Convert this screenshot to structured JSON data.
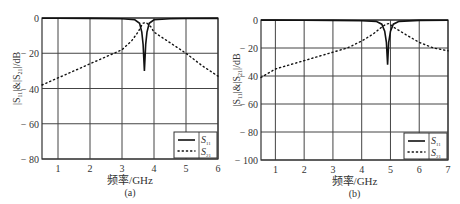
{
  "chart_data": [
    {
      "type": "line",
      "caption": "(a)",
      "xlabel": "频率/GHz",
      "ylabel": "|S11|&|S21|/dB",
      "xlim": [
        0.5,
        6
      ],
      "ylim": [
        -80,
        0
      ],
      "xticks": [
        1,
        2,
        3,
        4,
        5,
        6
      ],
      "yticks": [
        0,
        -20,
        -40,
        -60,
        -80
      ],
      "ytick_labels": [
        "0",
        "-20",
        "-40",
        "-60",
        "-80"
      ],
      "grid": true,
      "legend": {
        "position": "lower right",
        "entries": [
          "S11",
          "S21"
        ]
      },
      "series": [
        {
          "name": "S11",
          "style": "solid",
          "x": [
            0.5,
            1,
            2,
            3,
            3.4,
            3.55,
            3.62,
            3.66,
            3.7,
            3.74,
            3.78,
            3.85,
            4.0,
            4.5,
            5,
            6
          ],
          "y": [
            -0.1,
            -0.1,
            -0.2,
            -0.4,
            -1,
            -3,
            -8,
            -15,
            -30,
            -15,
            -8,
            -3,
            -1,
            -0.4,
            -0.3,
            -0.2
          ]
        },
        {
          "name": "S21",
          "style": "dotted",
          "x": [
            0.5,
            1,
            1.5,
            2,
            2.5,
            3,
            3.3,
            3.5,
            3.65,
            3.75,
            3.9,
            4.0,
            4.5,
            5,
            5.5,
            6
          ],
          "y": [
            -38,
            -34,
            -30,
            -26,
            -22,
            -18,
            -13,
            -8,
            -3,
            -2.5,
            -5,
            -8,
            -14,
            -20,
            -27,
            -33
          ]
        }
      ]
    },
    {
      "type": "line",
      "caption": "(b)",
      "xlabel": "频率/GHz",
      "ylabel": "|S11|&|S21|/dB",
      "xlim": [
        0.5,
        7
      ],
      "ylim": [
        -100,
        0
      ],
      "xticks": [
        1,
        2,
        3,
        4,
        5,
        6,
        7
      ],
      "yticks": [
        0,
        -20,
        -40,
        -60,
        -80,
        -100
      ],
      "ytick_labels": [
        "0",
        "-20",
        "-40",
        "-60",
        "-80",
        "-100"
      ],
      "grid": true,
      "legend": {
        "position": "lower right",
        "entries": [
          "S11",
          "S21"
        ]
      },
      "series": [
        {
          "name": "S11",
          "style": "solid",
          "x": [
            0.5,
            1,
            2,
            3,
            4,
            4.5,
            4.7,
            4.8,
            4.86,
            4.9,
            4.94,
            5.0,
            5.1,
            5.3,
            6,
            7
          ],
          "y": [
            -0.1,
            -0.1,
            -0.2,
            -0.3,
            -0.5,
            -1,
            -3,
            -8,
            -16,
            -32,
            -16,
            -8,
            -3,
            -1,
            -0.3,
            -0.2
          ]
        },
        {
          "name": "S21",
          "style": "dotted",
          "x": [
            0.5,
            1,
            2,
            3,
            3.5,
            4,
            4.4,
            4.7,
            4.85,
            4.95,
            5.1,
            5.5,
            6,
            6.5,
            7
          ],
          "y": [
            -41,
            -35,
            -29,
            -23,
            -20,
            -15,
            -10,
            -5,
            -3,
            -2.5,
            -5,
            -10,
            -16,
            -20,
            -22
          ]
        }
      ]
    }
  ],
  "panels": [
    {
      "caption": "(a)",
      "xlabel": "频率/GHz",
      "ylabel": "|S11|&|S21|/dB",
      "legend_s11": "S",
      "legend_s11_sub": "11",
      "legend_s21": "S",
      "legend_s21_sub": "21"
    },
    {
      "caption": "(b)",
      "xlabel": "频率/GHz",
      "ylabel": "|S11|&|S21|/dB",
      "legend_s11": "S",
      "legend_s11_sub": "11",
      "legend_s21": "S",
      "legend_s21_sub": "21"
    }
  ]
}
